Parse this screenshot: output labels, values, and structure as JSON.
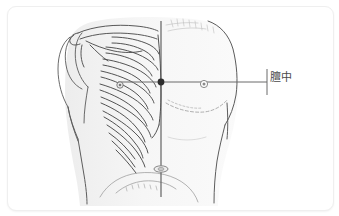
{
  "figure": {
    "kind": "anatomical-illustration",
    "background_color": "#ffffff",
    "card_border_color": "#efefef",
    "line_color": "#4a4a4a",
    "skin_shading_color": "#f2f2f2",
    "faint_line_color": "#b9b9b9"
  },
  "annotations": {
    "point_label": "膻中",
    "point_marker_name": "cv17-point-marker",
    "midline_name": "anterior-midline",
    "nipple_line_name": "intermammary-line"
  },
  "markers": {
    "cv17": {
      "x": 153,
      "y": 75,
      "color": "#333333"
    },
    "nipple_right": {
      "x": 196,
      "y": 77
    },
    "rib_point_left": {
      "x": 112,
      "y": 78
    },
    "navel": {
      "x": 153,
      "y": 162
    }
  },
  "leader_line": {
    "from_x": 153,
    "to_x": 259,
    "y": 75,
    "tick_top": 62,
    "tick_bottom": 88
  }
}
